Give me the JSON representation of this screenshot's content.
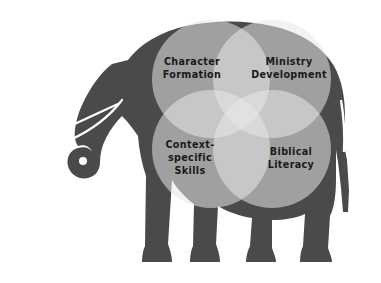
{
  "figure": {
    "type": "venn-diagram-on-silhouette",
    "background_color": "#ffffff",
    "silhouette": {
      "name": "elephant",
      "color": "#4a4a4a"
    }
  },
  "circles": [
    {
      "id": "character-formation",
      "label_lines": [
        "Character",
        "Formation"
      ],
      "position": "top-left",
      "cx": 211,
      "cy": 79,
      "r": 59,
      "fill": "#cfcfcf",
      "opacity": 0.55
    },
    {
      "id": "ministry-development",
      "label_lines": [
        "Ministry",
        "Development"
      ],
      "position": "top-right",
      "cx": 272,
      "cy": 79,
      "r": 59,
      "fill": "#cfcfcf",
      "opacity": 0.55
    },
    {
      "id": "context-specific-skills",
      "label_lines": [
        "Context-",
        "specific",
        "Skills"
      ],
      "position": "bottom-left",
      "cx": 211,
      "cy": 149,
      "r": 59,
      "fill": "#cfcfcf",
      "opacity": 0.55
    },
    {
      "id": "biblical-literacy",
      "label_lines": [
        "Biblical",
        "Literacy"
      ],
      "position": "bottom-right",
      "cx": 272,
      "cy": 149,
      "r": 59,
      "fill": "#cfcfcf",
      "opacity": 0.55
    }
  ],
  "labels": {
    "character_formation": {
      "line1": "Character",
      "line2": "Formation"
    },
    "ministry_development": {
      "line1": "Ministry",
      "line2": "Development"
    },
    "context_specific_skills": {
      "line1": "Context-",
      "line2": "specific",
      "line3": "Skills"
    },
    "biblical_literacy": {
      "line1": "Biblical",
      "line2": "Literacy"
    }
  },
  "colors": {
    "elephant": "#4a4a4a",
    "circle_fill": "#cfcfcf",
    "text": "#1a1a1a",
    "background": "#ffffff"
  }
}
